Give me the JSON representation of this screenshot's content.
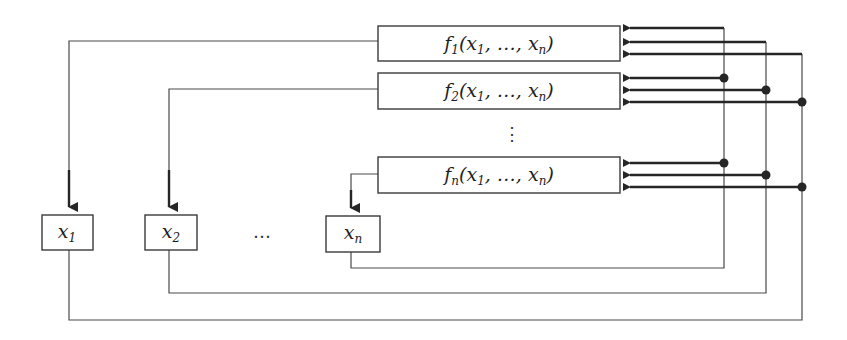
{
  "diagram": {
    "type": "system-of-equations-feedback",
    "function_boxes": [
      {
        "id": "f1",
        "name": "f",
        "sub": "1",
        "args_open": "(x",
        "args_sub1": "1",
        "args_mid": ", …, x",
        "args_subn": "n",
        "args_close": ")",
        "output_target": "x1"
      },
      {
        "id": "f2",
        "name": "f",
        "sub": "2",
        "args_open": "(x",
        "args_sub1": "1",
        "args_mid": ", …, x",
        "args_subn": "n",
        "args_close": ")",
        "output_target": "x2"
      },
      {
        "id": "fn",
        "name": "f",
        "sub": "n",
        "args_open": "(x",
        "args_sub1": "1",
        "args_mid": ", …, x",
        "args_subn": "n",
        "args_close": ")",
        "output_target": "xn"
      }
    ],
    "vertical_ellipsis": "⋮",
    "variable_boxes": [
      {
        "id": "x1",
        "name": "x",
        "sub": "1"
      },
      {
        "id": "x2",
        "name": "x",
        "sub": "2"
      },
      {
        "id": "xn",
        "name": "x",
        "sub": "n"
      }
    ],
    "horizontal_ellipsis": "…",
    "feedback_buses": [
      {
        "from": "x1",
        "to": [
          "f1",
          "f2",
          "fn"
        ],
        "input_index": 3
      },
      {
        "from": "x2",
        "to": [
          "f1",
          "f2",
          "fn"
        ],
        "input_index": 2
      },
      {
        "from": "xn",
        "to": [
          "f1",
          "f2",
          "fn"
        ],
        "input_index": 1
      }
    ],
    "colors": {
      "line": "#262626",
      "box_border": "#3a3a3a",
      "background": "#ffffff"
    }
  }
}
